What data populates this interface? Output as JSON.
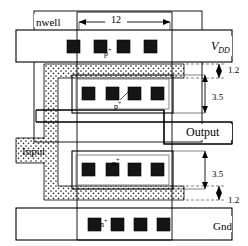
{
  "figure": {
    "width": 248,
    "height": 246,
    "background": "#ffffff",
    "line_color": "#000000",
    "contact_color": "#1a1a1a",
    "poly_fill": "stipple-dots"
  },
  "labels": {
    "nwell": "nwell",
    "vdd": "V",
    "vdd_sub": "DD",
    "gnd": "Gnd",
    "output": "Output",
    "input": "Input",
    "pplus_top": "p",
    "pplus_top_sup": "+",
    "pplus_mid": "p",
    "pplus_mid_sup": "+",
    "nplus_mid": "n",
    "nplus_mid_sup": "+",
    "nplus_bot": "n",
    "nplus_bot_sup": "+"
  },
  "dimensions": {
    "width_12": "12",
    "gap_top_1p2": "1.2",
    "pdiff_height_3p5": "3.5",
    "ndiff_height_3p5": "3.5",
    "gap_bot_1p2": "1.2"
  },
  "contacts": {
    "row_vdd": {
      "count": 4,
      "y": 40,
      "xs": [
        67,
        94,
        121,
        148
      ],
      "size": 13
    },
    "row_pdiff": {
      "count": 4,
      "y": 87,
      "xs": [
        78,
        105,
        132,
        159
      ],
      "size": 13
    },
    "row_ndiff": {
      "count": 4,
      "y": 163,
      "xs": [
        78,
        105,
        132,
        159
      ],
      "size": 13
    },
    "row_gnd": {
      "count": 4,
      "y": 218,
      "xs": [
        67,
        94,
        121,
        148
      ],
      "size": 13
    }
  },
  "regions": {
    "nwell_box": {
      "x": 34,
      "y": 11,
      "w": 168,
      "h": 131
    },
    "vdd_bar": {
      "x": 16,
      "y": 30,
      "w": 216,
      "h": 32
    },
    "gnd_bar": {
      "x": 16,
      "y": 208,
      "w": 216,
      "h": 32
    },
    "metal_column": {
      "x": 77,
      "y": 12,
      "w": 95,
      "h": 228
    },
    "pdiff_box": {
      "x": 75,
      "y": 78,
      "w": 95,
      "h": 32
    },
    "ndiff_box": {
      "x": 75,
      "y": 154,
      "w": 95,
      "h": 32
    },
    "output_bar": {
      "x": 36,
      "y": 122,
      "w": 196,
      "h": 22
    },
    "poly_gate": {
      "note": "stippled U-shaped polysilicon with Input tab at left"
    }
  }
}
